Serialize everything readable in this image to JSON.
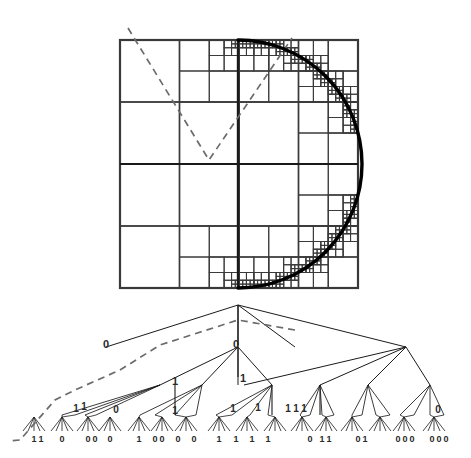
{
  "figure": {
    "type": "diagram",
    "colors": {
      "ink": "#1a1a1a",
      "grid": "#3a3a3a",
      "curve": "#000000",
      "dashed": "#6b6b6b",
      "background": "#ffffff",
      "label": "#2a2a2a"
    }
  },
  "quadtree_image": {
    "name": "quadtree-decomposition-square",
    "bounds": {
      "x": 120,
      "y": 40,
      "width": 238,
      "height": 248
    },
    "description": "Square domain recursively subdivided; fine cells follow a circular arc",
    "curve": {
      "name": "disk-boundary-arc",
      "kind": "circular-arc",
      "center_x": 238,
      "center_y": 164,
      "radius": 124,
      "start_angle_deg": -90,
      "end_angle_deg": 90
    },
    "dashed_path": {
      "name": "space-filling-curve-dashed",
      "points": [
        [
          128,
          28
        ],
        [
          209,
          160
        ],
        [
          292,
          38
        ]
      ]
    },
    "major_splits": {
      "vertical_center": 238,
      "horizontal_center": 164
    }
  },
  "tree": {
    "name": "quadtree-node-tree",
    "root": {
      "x": 238,
      "y": 305
    },
    "depth_levels": 4,
    "level_y": [
      305,
      347,
      385,
      415,
      437
    ],
    "dashed_path": {
      "name": "tree-traversal-dashed",
      "points": [
        [
          295,
          330
        ],
        [
          238,
          320
        ],
        [
          160,
          345
        ],
        [
          120,
          370
        ],
        [
          75,
          390
        ],
        [
          55,
          400
        ],
        [
          20,
          440
        ],
        [
          8,
          441
        ]
      ]
    },
    "labels": [
      {
        "text": "0",
        "x": 106,
        "y": 348,
        "size": 11
      },
      {
        "text": "0",
        "x": 236,
        "y": 348,
        "size": 11
      },
      {
        "text": "1",
        "x": 175,
        "y": 385,
        "size": 11
      },
      {
        "text": "1",
        "x": 243,
        "y": 382,
        "size": 11
      },
      {
        "text": "1",
        "x": 76,
        "y": 412,
        "size": 10
      },
      {
        "text": "1",
        "x": 84,
        "y": 410,
        "size": 10
      },
      {
        "text": "0",
        "x": 116,
        "y": 413,
        "size": 10
      },
      {
        "text": "1",
        "x": 175,
        "y": 414,
        "size": 10
      },
      {
        "text": "1",
        "x": 233,
        "y": 412,
        "size": 10
      },
      {
        "text": "1",
        "x": 258,
        "y": 411,
        "size": 10
      },
      {
        "text": "1",
        "x": 288,
        "y": 412,
        "size": 10
      },
      {
        "text": "1",
        "x": 296,
        "y": 412,
        "size": 10
      },
      {
        "text": "1",
        "x": 304,
        "y": 412,
        "size": 10
      },
      {
        "text": "0",
        "x": 438,
        "y": 413,
        "size": 10
      }
    ],
    "leaf_labels": [
      {
        "text": "1",
        "x": 34,
        "y": 442
      },
      {
        "text": "1",
        "x": 41,
        "y": 442
      },
      {
        "text": "0",
        "x": 62,
        "y": 442
      },
      {
        "text": "0",
        "x": 88,
        "y": 442
      },
      {
        "text": "0",
        "x": 95,
        "y": 442
      },
      {
        "text": "0",
        "x": 110,
        "y": 442
      },
      {
        "text": "1",
        "x": 139,
        "y": 442
      },
      {
        "text": "0",
        "x": 155,
        "y": 442
      },
      {
        "text": "0",
        "x": 162,
        "y": 442
      },
      {
        "text": "0",
        "x": 178,
        "y": 442
      },
      {
        "text": "0",
        "x": 194,
        "y": 442
      },
      {
        "text": "1",
        "x": 219,
        "y": 442
      },
      {
        "text": "1",
        "x": 236,
        "y": 442
      },
      {
        "text": "1",
        "x": 252,
        "y": 442
      },
      {
        "text": "1",
        "x": 268,
        "y": 442
      },
      {
        "text": "0",
        "x": 310,
        "y": 442
      },
      {
        "text": "1",
        "x": 322,
        "y": 442
      },
      {
        "text": "1",
        "x": 329,
        "y": 442
      },
      {
        "text": "0",
        "x": 358,
        "y": 442
      },
      {
        "text": "1",
        "x": 365,
        "y": 442
      },
      {
        "text": "0",
        "x": 398,
        "y": 442
      },
      {
        "text": "0",
        "x": 405,
        "y": 442
      },
      {
        "text": "0",
        "x": 412,
        "y": 442
      },
      {
        "text": "0",
        "x": 432,
        "y": 442
      },
      {
        "text": "0",
        "x": 439,
        "y": 442
      },
      {
        "text": "0",
        "x": 446,
        "y": 442
      }
    ]
  }
}
